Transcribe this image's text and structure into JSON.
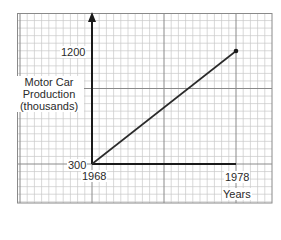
{
  "chart_data": {
    "type": "line",
    "title": "",
    "xlabel": "Years",
    "ylabel": "Motor Car Production (thousands)",
    "ylabel_lines": [
      "Motor Car",
      "Production",
      "(thousands)"
    ],
    "x": [
      1968,
      1978
    ],
    "series": [
      {
        "name": "Motor Car Production",
        "values": [
          300,
          1200
        ]
      }
    ],
    "x_tick_labels": [
      "1968",
      "1978"
    ],
    "y_tick_labels": [
      "300",
      "1200"
    ],
    "xlim": [
      1968,
      1978
    ],
    "ylim": [
      300,
      1200
    ],
    "grid": true,
    "grid_style": "graph paper (minor + major lines)",
    "legend": "none",
    "endpoint_marker": true,
    "note": "The y-axis has no numeric scale. 300 marks the origin and 1200 marks the line's end; the 1200 tick does not fall on a major gridline."
  },
  "labels": {
    "y_top": "1200",
    "y_origin": "300",
    "x_origin": "1968",
    "x_end": "1978",
    "x_axis_title": "Years",
    "y_axis_title": [
      "Motor Car",
      "Production",
      "(thousands)"
    ]
  },
  "colors": {
    "grid_minor": "#c8c8c8",
    "grid_major": "#8a8a8a",
    "axis": "#1a1a1a",
    "line": "#2a2a2a"
  }
}
